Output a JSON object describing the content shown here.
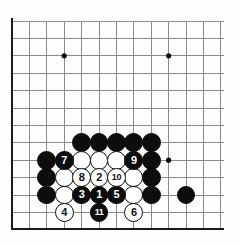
{
  "diagram": {
    "kind": "go-board-diagram",
    "board_size": 19,
    "view": {
      "note": "top-left corner region of a go board, showing left edge and bottom edge",
      "columns": 13,
      "rows": 12
    },
    "geometry": {
      "origin_x": 12,
      "origin_y": 21,
      "step": 17.4,
      "stone_radius": 9.4,
      "left_edge_x": 12,
      "bottom_edge_y": 229,
      "edge_thickness": 2.6,
      "line_thickness": 1
    },
    "colors": {
      "background": "#fdfdfc",
      "grid_line": "#8a8a8a",
      "edge_line": "#1a1a1a",
      "black_stone": "#0d0d0d",
      "white_stone": "#ffffff",
      "white_stone_border": "#111111",
      "black_label_text": "#ffffff",
      "white_label_text": "#111111",
      "star_point": "#0d0d0d"
    },
    "star_points": [
      {
        "col": 3,
        "row": 2
      },
      {
        "col": 9,
        "row": 2
      },
      {
        "col": 9,
        "row": 8
      }
    ],
    "stones": [
      {
        "col": 4,
        "row": 7,
        "color": "black",
        "label": ""
      },
      {
        "col": 5,
        "row": 7,
        "color": "black",
        "label": ""
      },
      {
        "col": 6,
        "row": 7,
        "color": "black",
        "label": ""
      },
      {
        "col": 7,
        "row": 7,
        "color": "black",
        "label": ""
      },
      {
        "col": 8,
        "row": 7,
        "color": "black",
        "label": ""
      },
      {
        "col": 2,
        "row": 8,
        "color": "black",
        "label": ""
      },
      {
        "col": 3,
        "row": 8,
        "color": "black",
        "label": "7"
      },
      {
        "col": 4,
        "row": 8,
        "color": "white",
        "label": ""
      },
      {
        "col": 5,
        "row": 8,
        "color": "white",
        "label": ""
      },
      {
        "col": 6,
        "row": 8,
        "color": "white",
        "label": ""
      },
      {
        "col": 7,
        "row": 8,
        "color": "black",
        "label": "9"
      },
      {
        "col": 8,
        "row": 8,
        "color": "black",
        "label": ""
      },
      {
        "col": 2,
        "row": 9,
        "color": "black",
        "label": ""
      },
      {
        "col": 3,
        "row": 9,
        "color": "white",
        "label": ""
      },
      {
        "col": 4,
        "row": 9,
        "color": "white",
        "label": "8"
      },
      {
        "col": 5,
        "row": 9,
        "color": "white",
        "label": "2"
      },
      {
        "col": 6,
        "row": 9,
        "color": "white",
        "label": "10"
      },
      {
        "col": 7,
        "row": 9,
        "color": "white",
        "label": ""
      },
      {
        "col": 8,
        "row": 9,
        "color": "black",
        "label": ""
      },
      {
        "col": 2,
        "row": 10,
        "color": "black",
        "label": ""
      },
      {
        "col": 3,
        "row": 10,
        "color": "white",
        "label": ""
      },
      {
        "col": 4,
        "row": 10,
        "color": "black",
        "label": "3"
      },
      {
        "col": 5,
        "row": 10,
        "color": "black",
        "label": "1"
      },
      {
        "col": 6,
        "row": 10,
        "color": "black",
        "label": "5"
      },
      {
        "col": 7,
        "row": 10,
        "color": "white",
        "label": ""
      },
      {
        "col": 8,
        "row": 10,
        "color": "black",
        "label": ""
      },
      {
        "col": 10,
        "row": 10,
        "color": "black",
        "label": ""
      },
      {
        "col": 3,
        "row": 11,
        "color": "white",
        "label": "4"
      },
      {
        "col": 5,
        "row": 11,
        "color": "black",
        "label": "11"
      },
      {
        "col": 7,
        "row": 11,
        "color": "white",
        "label": "6"
      }
    ],
    "move_sequence": [
      {
        "number": "1",
        "color": "black",
        "col": 5,
        "row": 10
      },
      {
        "number": "2",
        "color": "white",
        "col": 5,
        "row": 9
      },
      {
        "number": "3",
        "color": "black",
        "col": 4,
        "row": 10
      },
      {
        "number": "4",
        "color": "white",
        "col": 3,
        "row": 11
      },
      {
        "number": "5",
        "color": "black",
        "col": 6,
        "row": 10
      },
      {
        "number": "6",
        "color": "white",
        "col": 7,
        "row": 11
      },
      {
        "number": "7",
        "color": "black",
        "col": 3,
        "row": 8
      },
      {
        "number": "8",
        "color": "white",
        "col": 4,
        "row": 9
      },
      {
        "number": "9",
        "color": "black",
        "col": 7,
        "row": 8
      },
      {
        "number": "10",
        "color": "white",
        "col": 6,
        "row": 9
      },
      {
        "number": "11",
        "color": "black",
        "col": 5,
        "row": 11
      }
    ]
  }
}
